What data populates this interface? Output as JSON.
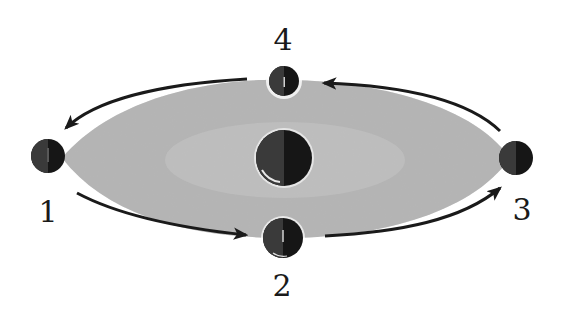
{
  "diagram": {
    "type": "orbit",
    "colors": {
      "orbit_fill": "#b8b8b8",
      "orbit_fill_dark": "#9a9a9a",
      "body": "#141414",
      "body_shadow_side": "#2a2a2a",
      "arrow": "#1a1a1a",
      "label": "#1a1a1a",
      "background": "#ffffff"
    },
    "central_body": {
      "name": "central-body"
    },
    "positions": [
      {
        "id": "1",
        "label": "1",
        "location": "left"
      },
      {
        "id": "2",
        "label": "2",
        "location": "bottom"
      },
      {
        "id": "3",
        "label": "3",
        "location": "right"
      },
      {
        "id": "4",
        "label": "4",
        "location": "top"
      }
    ],
    "arrows": [
      {
        "from": "1",
        "to": "2",
        "direction": "counterclockwise"
      },
      {
        "from": "2",
        "to": "3",
        "direction": "counterclockwise"
      },
      {
        "from": "3",
        "to": "4",
        "direction": "counterclockwise"
      },
      {
        "from": "4",
        "to": "1",
        "direction": "counterclockwise"
      }
    ]
  }
}
